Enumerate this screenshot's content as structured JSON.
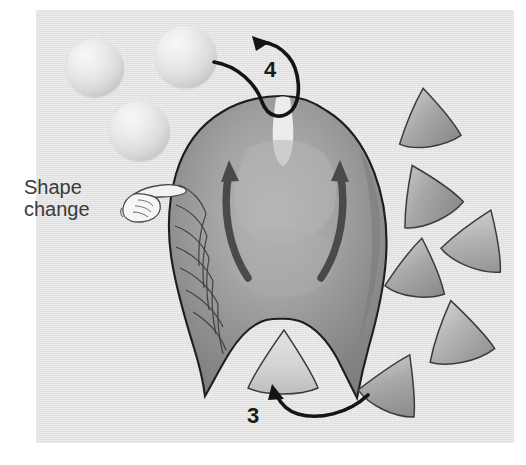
{
  "figure": {
    "panel": {
      "background_color": "#e3e3e3",
      "left": 36,
      "top": 10,
      "width": 478,
      "height": 433
    },
    "annotation": {
      "shape_change_label": "Shape\nchange",
      "shape_change_line1": "Shape",
      "shape_change_line2": "change",
      "hand_icon_name": "pointing-hand-icon",
      "text_color": "#3a3a3a"
    },
    "step_labels": [
      {
        "id": "step-4",
        "text": "4",
        "x": 266,
        "y": 58,
        "description": "curved arrow from sphere up and over the apical notch"
      },
      {
        "id": "step-3",
        "text": "3",
        "x": 252,
        "y": 404,
        "description": "curved arrow from cone up into the basal notch"
      }
    ],
    "spheres": [
      {
        "id": "sphere-1",
        "cx": 95,
        "cy": 68,
        "r": 29,
        "fill": "#e8e8e8"
      },
      {
        "id": "sphere-2",
        "cx": 186,
        "cy": 57,
        "r": 31,
        "fill": "#e8e8e8"
      },
      {
        "id": "sphere-3",
        "cx": 140,
        "cy": 131,
        "r": 30,
        "fill": "#e8e8e8"
      }
    ],
    "cones": [
      {
        "id": "cone-1",
        "x": 396,
        "y": 88,
        "w": 62,
        "h": 56,
        "rot": -8,
        "fill": "#a9a9a9"
      },
      {
        "id": "cone-2",
        "x": 392,
        "y": 163,
        "w": 64,
        "h": 58,
        "rot": -22,
        "fill": "#a6a6a6"
      },
      {
        "id": "cone-3",
        "x": 448,
        "y": 208,
        "w": 64,
        "h": 58,
        "rot": 22,
        "fill": "#b0b0b0"
      },
      {
        "id": "cone-4",
        "x": 388,
        "y": 238,
        "w": 60,
        "h": 56,
        "rot": 8,
        "fill": "#ababab"
      },
      {
        "id": "cone-5",
        "x": 424,
        "y": 300,
        "w": 66,
        "h": 60,
        "rot": -14,
        "fill": "#b2b2b2"
      },
      {
        "id": "cone-6",
        "x": 366,
        "y": 352,
        "w": 62,
        "h": 58,
        "rot": 26,
        "fill": "#acacac"
      },
      {
        "id": "cone-incorporated",
        "x": 252,
        "y": 330,
        "w": 62,
        "h": 56,
        "rot": 0,
        "fill": "#d0d0d0"
      }
    ],
    "body": {
      "id": "central-body",
      "description": "pear-shaped organic body with apical notch, two internal curved arrows, scale texture on left flank, and two basal prongs",
      "fill_dark": "#8c8c8c",
      "fill_mid": "#9b9b9b",
      "fill_light": "#b8b8b8",
      "outline": "#1e1e1e",
      "internal_arrows": 2,
      "internal_arrow_direction": "upward"
    },
    "colors": {
      "panel_bg": "#e3e3e3",
      "page_bg": "#ffffff",
      "ink": "#1a1a1a",
      "body_outline": "#1e1e1e",
      "label_text": "#3a3a3a"
    }
  }
}
